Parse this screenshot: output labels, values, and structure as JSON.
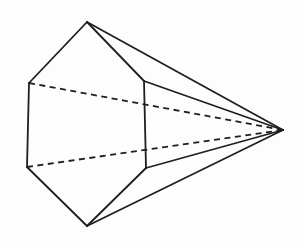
{
  "figure": {
    "background_color": "#fdfdfd",
    "stroke_color": "#1f1f1f",
    "stroke_width": 1.8,
    "dash_pattern": "6 4.5",
    "vertices": {
      "top": [
        87,
        22
      ],
      "upper_left": [
        29,
        83
      ],
      "lower_left": [
        27,
        167
      ],
      "bottom": [
        87,
        226
      ],
      "lower_right": [
        146,
        168
      ],
      "upper_right": [
        144,
        81
      ],
      "apex": [
        283,
        130
      ]
    },
    "edges": [
      {
        "from": "top",
        "to": "upper_left",
        "style": "solid"
      },
      {
        "from": "upper_left",
        "to": "lower_left",
        "style": "solid"
      },
      {
        "from": "lower_left",
        "to": "bottom",
        "style": "solid"
      },
      {
        "from": "bottom",
        "to": "lower_right",
        "style": "solid"
      },
      {
        "from": "lower_right",
        "to": "upper_right",
        "style": "solid"
      },
      {
        "from": "upper_right",
        "to": "top",
        "style": "solid"
      },
      {
        "from": "top",
        "to": "apex",
        "style": "solid"
      },
      {
        "from": "upper_right",
        "to": "apex",
        "style": "solid"
      },
      {
        "from": "lower_right",
        "to": "apex",
        "style": "solid"
      },
      {
        "from": "bottom",
        "to": "apex",
        "style": "solid"
      },
      {
        "from": "upper_left",
        "to": "apex",
        "style": "dashed"
      },
      {
        "from": "lower_left",
        "to": "apex",
        "style": "dashed"
      }
    ]
  }
}
